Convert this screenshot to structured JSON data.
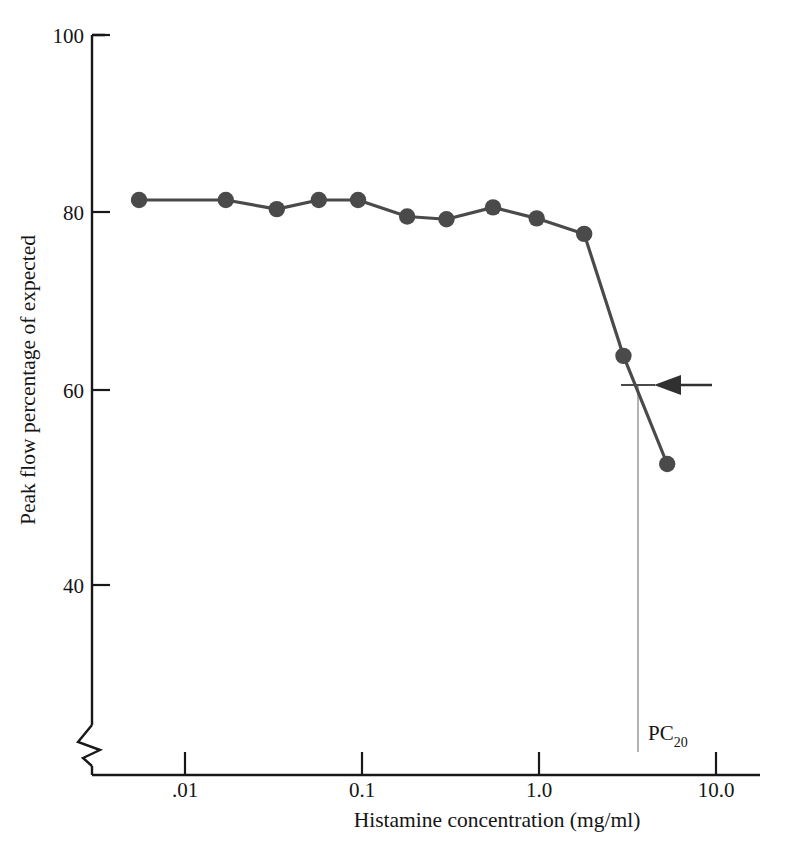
{
  "chart_data": {
    "type": "line",
    "title": "",
    "xlabel": "Histamine concentration (mg/ml)",
    "ylabel": "Peak flow percentage of expected",
    "x_scale": "log",
    "x_tick_labels": [
      ".01",
      "0.1",
      "1.0",
      "10.0"
    ],
    "x_tick_values": [
      0.01,
      0.1,
      1.0,
      10.0
    ],
    "y_tick_labels": [
      "100",
      "80",
      "60",
      "40"
    ],
    "y_tick_values": [
      100,
      80,
      60,
      40
    ],
    "ylim": [
      34,
      100
    ],
    "xlim": [
      0.004,
      16
    ],
    "y_axis_break": true,
    "grid": false,
    "legend": null,
    "marker": "filled-circle",
    "series": [
      {
        "name": "Peak flow",
        "color": "#4a4a4a",
        "x": [
          0.0055,
          0.017,
          0.033,
          0.057,
          0.095,
          0.18,
          0.3,
          0.55,
          0.97,
          1.8,
          3.0,
          5.3
        ],
        "y": [
          82,
          82,
          81,
          82,
          82,
          80.2,
          79.9,
          81.2,
          80,
          78.3,
          65,
          53.2
        ]
      }
    ],
    "annotations": [
      {
        "name": "pc20-marker",
        "label": "PC",
        "label_subscript": "20",
        "x_value": 3.4,
        "y_value": 61,
        "kind": "vertical-drop-line-with-arrow",
        "arrow_direction": "left"
      }
    ]
  },
  "axes": {
    "y_title": "Peak flow percentage of expected",
    "x_title": "Histamine concentration (mg/ml)"
  }
}
